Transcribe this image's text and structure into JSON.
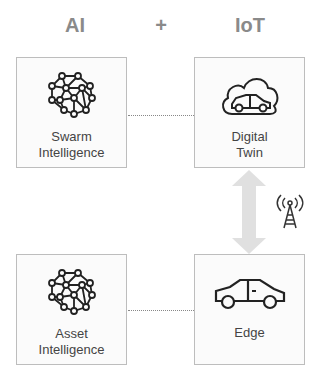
{
  "headers": {
    "left": "AI",
    "plus": "+",
    "right": "IoT"
  },
  "boxes": {
    "swarm": {
      "line1": "Swarm",
      "line2": "Intelligence",
      "icon": "neural-network-brain-icon"
    },
    "twin": {
      "line1": "Digital",
      "line2": "Twin",
      "icon": "cloud-car-icon"
    },
    "asset": {
      "line1": "Asset",
      "line2": "Intelligence",
      "icon": "neural-network-brain-icon"
    },
    "edge": {
      "line1": "Edge",
      "icon": "car-icon"
    }
  },
  "connectors": {
    "arrow_icon": "bidirectional-arrow-icon",
    "tower_icon": "radio-tower-icon"
  },
  "colors": {
    "header": "#8a8a8a",
    "border": "#bdbdbd",
    "arrow": "#e0e0e0",
    "icon": "#222222"
  }
}
